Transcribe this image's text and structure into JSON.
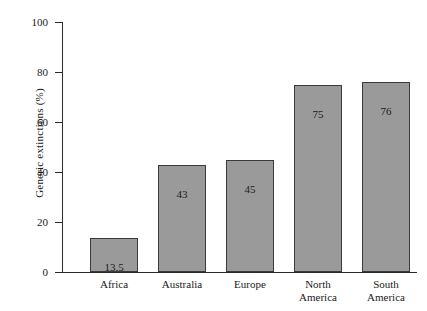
{
  "chart_data": {
    "type": "bar",
    "title": "",
    "xlabel": "",
    "ylabel": "Generic extinctions (%)",
    "categories": [
      "Africa",
      "Australia",
      "Europe",
      "North America",
      "South America"
    ],
    "category_lines": [
      [
        "Africa"
      ],
      [
        "Australia"
      ],
      [
        "Europe"
      ],
      [
        "North",
        "America"
      ],
      [
        "South",
        "America"
      ]
    ],
    "values": [
      13.5,
      43,
      45,
      75,
      76
    ],
    "value_labels": [
      "13.5",
      "43",
      "45",
      "75",
      "76"
    ],
    "ylim": [
      0,
      100
    ],
    "yticks": [
      0,
      20,
      40,
      60,
      80,
      100
    ],
    "ytick_labels": [
      "0",
      "20",
      "40",
      "60",
      "80",
      "100"
    ],
    "grid": false,
    "legend": "none",
    "bar_fill_color": "#9a9a9a",
    "bar_edge_color": "#3a3a3a",
    "axis_color": "#2b2b2b"
  }
}
